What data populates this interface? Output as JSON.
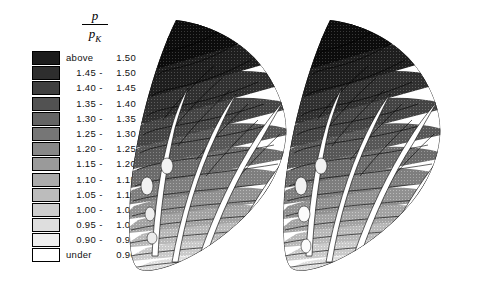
{
  "figure": {
    "kind": "pressure-contour-cascade",
    "background": "#ffffff",
    "width": 493,
    "height": 294
  },
  "legend": {
    "title": {
      "numerator": "p",
      "denominator": "p",
      "denominator_sub": "K"
    },
    "above_word": "above",
    "under_word": "under",
    "dash": "-",
    "rows": [
      {
        "type": "above",
        "lo": "above",
        "hi": "1.50",
        "gray": "#1c1c1c"
      },
      {
        "type": "range",
        "lo": "1.45",
        "hi": "1.50",
        "gray": "#2e2e2e"
      },
      {
        "type": "range",
        "lo": "1.40",
        "hi": "1.45",
        "gray": "#3f3f3f"
      },
      {
        "type": "range",
        "lo": "1.35",
        "hi": "1.40",
        "gray": "#525252"
      },
      {
        "type": "range",
        "lo": "1.30",
        "hi": "1.35",
        "gray": "#646464"
      },
      {
        "type": "range",
        "lo": "1.25",
        "hi": "1.30",
        "gray": "#767676"
      },
      {
        "type": "range",
        "lo": "1.20",
        "hi": "1.25",
        "gray": "#888888"
      },
      {
        "type": "range",
        "lo": "1.15",
        "hi": "1.20",
        "gray": "#9a9a9a"
      },
      {
        "type": "range",
        "lo": "1.10",
        "hi": "1.15",
        "gray": "#ababab"
      },
      {
        "type": "range",
        "lo": "1.05",
        "hi": "1.10",
        "gray": "#bcbcbc"
      },
      {
        "type": "range",
        "lo": "1.00",
        "hi": "1.05",
        "gray": "#cdcdcd"
      },
      {
        "type": "range",
        "lo": "0.95",
        "hi": "1.00",
        "gray": "#dedede"
      },
      {
        "type": "range",
        "lo": "0.90",
        "hi": "0.95",
        "gray": "#efefef"
      },
      {
        "type": "under",
        "lo": "under",
        "hi": "0.90",
        "gray": "#ffffff"
      }
    ]
  },
  "chart_data": {
    "type": "heatmap",
    "title": "",
    "subtitle": "",
    "xlabel": "",
    "ylabel": "",
    "grid": false,
    "legend_position": "left",
    "quantity": "p/p_K",
    "colorbar_label": "p/p_K",
    "levels": [
      0.9,
      0.95,
      1.0,
      1.05,
      1.1,
      1.15,
      1.2,
      1.25,
      1.3,
      1.35,
      1.4,
      1.45,
      1.5
    ],
    "level_labels": [
      "under 0.90",
      "0.90 - 0.95",
      "0.95 - 1.00",
      "1.00 - 1.05",
      "1.05 - 1.10",
      "1.10 - 1.15",
      "1.15 - 1.20",
      "1.20 - 1.25",
      "1.25 - 1.30",
      "1.30 - 1.35",
      "1.35 - 1.40",
      "1.40 - 1.45",
      "1.45 - 1.50",
      "above 1.50"
    ],
    "vmin": 0.9,
    "vmax": 1.5,
    "colormap": "grayscale-inverted",
    "panels": [
      {
        "name": "left-cascade",
        "blade_count": 4,
        "outer_radius_value": 1.52,
        "inner_radius_value": 0.92,
        "annulus_sector_deg": 62,
        "high_pressure_region": "outer-arc",
        "low_pressure_region": "inner-hub"
      },
      {
        "name": "right-cascade",
        "blade_count": 4,
        "outer_radius_value": 1.52,
        "inner_radius_value": 0.92,
        "annulus_sector_deg": 62,
        "high_pressure_region": "outer-arc",
        "low_pressure_region": "inner-hub"
      }
    ]
  }
}
